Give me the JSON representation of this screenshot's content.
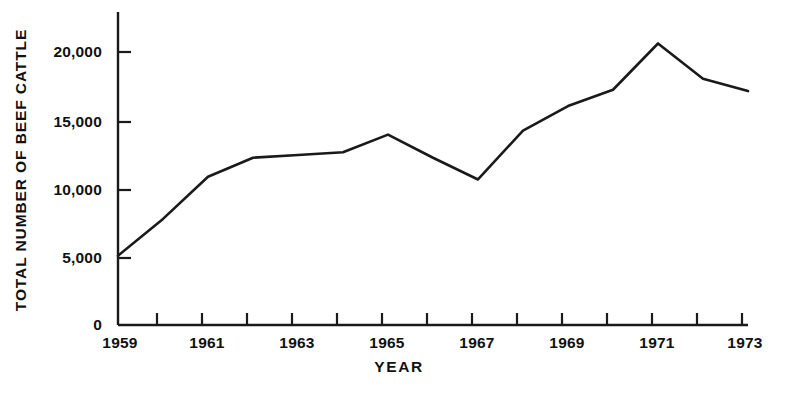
{
  "chart_data": {
    "type": "line",
    "title": "",
    "xlabel": "YEAR",
    "ylabel": "TOTAL NUMBER OF BEEF CATTLE",
    "x": [
      1959,
      1960,
      1961,
      1962,
      1963,
      1964,
      1965,
      1966,
      1967,
      1968,
      1969,
      1970,
      1971,
      1972,
      1973
    ],
    "values": [
      5100,
      7800,
      10900,
      12300,
      12500,
      12700,
      14000,
      12300,
      10700,
      14300,
      16100,
      17300,
      20700,
      18100,
      17200
    ],
    "series": [
      {
        "name": "Total number of beef cattle",
        "values": [
          5100,
          7800,
          10900,
          12300,
          12500,
          12700,
          14000,
          12300,
          10700,
          14300,
          16100,
          17300,
          20700,
          18100,
          17200
        ]
      }
    ],
    "xlim": [
      1959,
      1973
    ],
    "ylim": [
      0,
      21500
    ],
    "x_major_ticks": [
      1959,
      1961,
      1963,
      1965,
      1967,
      1969,
      1971,
      1973
    ],
    "x_all_ticks": [
      1959,
      1960,
      1961,
      1962,
      1963,
      1964,
      1965,
      1966,
      1967,
      1968,
      1969,
      1970,
      1971,
      1972,
      1973
    ],
    "xtick_labels": [
      "1959",
      "1961",
      "1963",
      "1965",
      "1967",
      "1969",
      "1971",
      "1973"
    ],
    "ytick_values": [
      0,
      5000,
      10000,
      15000,
      20000
    ],
    "ytick_labels": [
      "0",
      "5,000",
      "10,000",
      "15,000",
      "20,000"
    ],
    "grid": false,
    "legend": "none",
    "line_color": "#1a1a1a",
    "axis_color": "#1a1a1a",
    "background_color": "#ffffff"
  }
}
